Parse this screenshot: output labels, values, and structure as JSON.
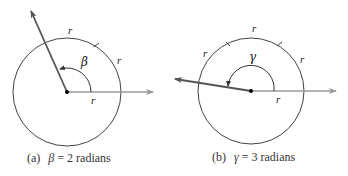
{
  "figures": [
    {
      "id": "a",
      "caption_prefix": "(a)",
      "angle_symbol": "β",
      "caption_suffix": " = 2 radians",
      "arc_labels": [
        "r",
        "r",
        "r"
      ],
      "angle_radians": 2,
      "colors": {
        "circle": "#444444",
        "terminal_ray": "#555555",
        "initial_ray": "#9a9a9a"
      }
    },
    {
      "id": "b",
      "caption_prefix": "(b)",
      "angle_symbol": "γ",
      "caption_suffix": " = 3 radians",
      "arc_labels": [
        "r",
        "r",
        "r",
        "r"
      ],
      "angle_radians": 3,
      "colors": {
        "circle": "#444444",
        "terminal_ray": "#555555",
        "initial_ray": "#9a9a9a"
      }
    }
  ]
}
